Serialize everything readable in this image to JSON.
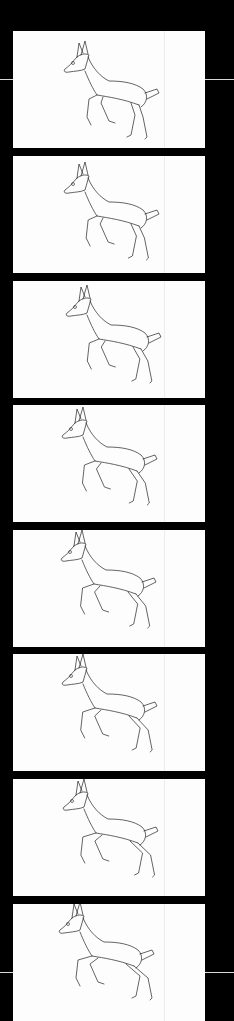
{
  "sequence": {
    "subject": "running deer line drawing",
    "frame_count": 8,
    "background_color": "#000000",
    "frame_color": "#fdfdfd",
    "line_color": "#222222",
    "frames": [
      {
        "index": 1,
        "top": 31,
        "dx": 0,
        "dy": 0,
        "leg": 0
      },
      {
        "index": 2,
        "top": 156,
        "dx": 0,
        "dy": -4,
        "leg": 1
      },
      {
        "index": 3,
        "top": 281,
        "dx": 2,
        "dy": -6,
        "leg": 2
      },
      {
        "index": 4,
        "top": 405,
        "dx": -2,
        "dy": -8,
        "leg": 3
      },
      {
        "index": 5,
        "top": 530,
        "dx": -3,
        "dy": -10,
        "leg": 4
      },
      {
        "index": 6,
        "top": 654,
        "dx": -2,
        "dy": -10,
        "leg": 5
      },
      {
        "index": 7,
        "top": 779,
        "dx": -1,
        "dy": -10,
        "leg": 6
      },
      {
        "index": 8,
        "top": 904,
        "dx": -5,
        "dy": -12,
        "leg": 7
      }
    ]
  }
}
